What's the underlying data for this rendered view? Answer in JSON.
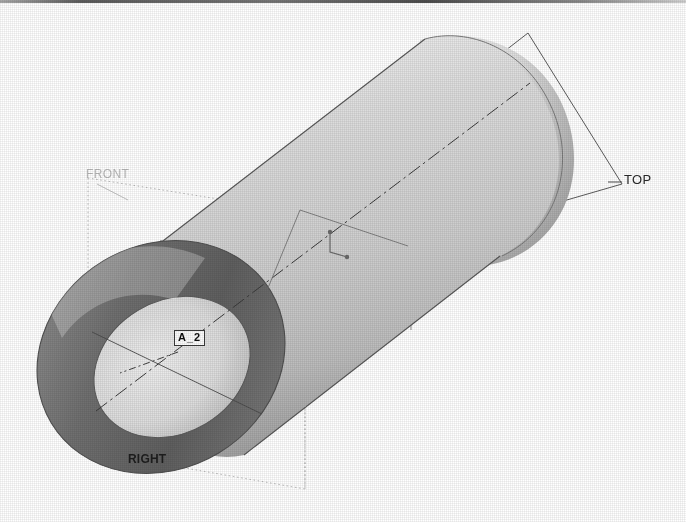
{
  "view": {
    "title": "3D Isometric CAD Model View",
    "model_description": "Hollow cylindrical tube (bushing) shown in shaded isometric orientation with reference datum planes",
    "background_color": "#ffffff",
    "render_style": "shaded-grayscale-scan"
  },
  "datum_planes": [
    {
      "id": "top",
      "label": "TOP",
      "color": "#2a2a2a",
      "line_style": "solid",
      "leader": true
    },
    {
      "id": "front",
      "label": "FRONT",
      "color": "#b9b9b9",
      "line_style": "dotted",
      "leader": true
    },
    {
      "id": "right",
      "label": "RIGHT",
      "color": "#1d1d1d",
      "line_style": "solid",
      "leader": false
    }
  ],
  "datum_axis": {
    "label": "A_2",
    "tag_fill": "#fbfbfb",
    "tag_border": "#3a3a3a",
    "line_style": "dash-dot"
  },
  "geometry": {
    "shape": "hollow-cylinder",
    "near_face": "annulus",
    "far_end": "rounded-cap",
    "outer_surface_shading": "gradient",
    "colors": {
      "outer_surface_light": "#e8e8e8",
      "outer_surface_mid": "#c4c4c4",
      "outer_surface_dark": "#8f8f8f",
      "end_face_dark": "#6d6d6d",
      "bore_light": "#dcdcdc",
      "edge_line": "#4a4a4a"
    }
  },
  "artifacts": {
    "top_scan_line": "scanned-page-edge",
    "halftone_grain": true
  }
}
